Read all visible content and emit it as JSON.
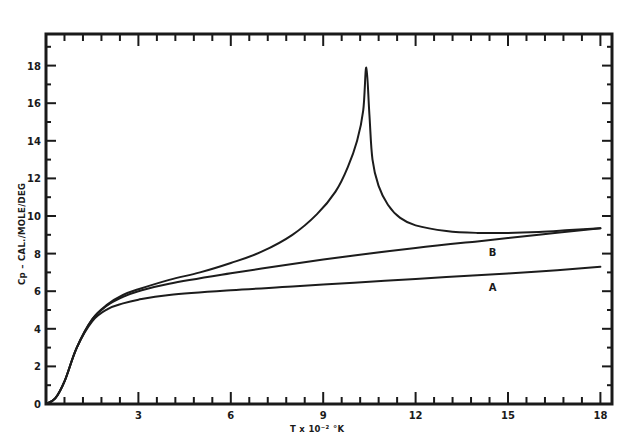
{
  "chart_data": {
    "type": "line",
    "title": "",
    "xlabel": "T x 10⁻² °K",
    "ylabel": "Cp – CAL./MOLE/DEG",
    "xlim": [
      0,
      18.5
    ],
    "ylim": [
      0,
      19.5
    ],
    "grid": false,
    "legend": "inline curve labels",
    "x_ticks": [
      0,
      3,
      6,
      9,
      12,
      15,
      18
    ],
    "x_tick_labels": [
      "",
      "3",
      "6",
      "9",
      "12",
      "15",
      "18"
    ],
    "x_minor_step": 0.6,
    "y_ticks": [
      0,
      2,
      4,
      6,
      8,
      10,
      12,
      14,
      16,
      18
    ],
    "y_tick_labels": [
      "0",
      "2",
      "4",
      "6",
      "8",
      "10",
      "12",
      "14",
      "16",
      "18"
    ],
    "y_minor_step": 1,
    "series": [
      {
        "name": "upper (lambda peak)",
        "label": "",
        "x": [
          0,
          0.3,
          0.6,
          1.0,
          1.5,
          2.0,
          2.5,
          3.0,
          4.0,
          5.0,
          6.0,
          7.0,
          8.0,
          8.8,
          9.4,
          9.8,
          10.1,
          10.3,
          10.4,
          10.5,
          10.6,
          10.8,
          11.1,
          11.5,
          12.0,
          13.0,
          14.0,
          15.0,
          16.0,
          17.0,
          18.0
        ],
        "y": [
          0,
          0.3,
          1.2,
          3.0,
          4.5,
          5.3,
          5.8,
          6.1,
          6.6,
          7.0,
          7.5,
          8.1,
          9.0,
          10.1,
          11.3,
          12.6,
          14.0,
          15.6,
          17.9,
          15.4,
          13.0,
          11.6,
          10.6,
          9.9,
          9.5,
          9.2,
          9.1,
          9.1,
          9.15,
          9.25,
          9.35
        ]
      },
      {
        "name": "B",
        "label": "B",
        "x": [
          0,
          0.3,
          0.6,
          1.0,
          1.5,
          2.0,
          2.5,
          3.0,
          4.0,
          6.0,
          8.0,
          10.0,
          12.0,
          14.0,
          16.0,
          18.0
        ],
        "y": [
          0,
          0.3,
          1.2,
          3.0,
          4.5,
          5.25,
          5.7,
          6.0,
          6.4,
          6.95,
          7.45,
          7.9,
          8.3,
          8.65,
          9.0,
          9.35
        ]
      },
      {
        "name": "A",
        "label": "A",
        "x": [
          0,
          0.3,
          0.6,
          1.0,
          1.5,
          2.0,
          2.5,
          3.0,
          4.0,
          6.0,
          8.0,
          10.0,
          12.0,
          14.0,
          16.0,
          18.0
        ],
        "y": [
          0,
          0.3,
          1.2,
          3.0,
          4.4,
          5.05,
          5.35,
          5.55,
          5.8,
          6.05,
          6.25,
          6.45,
          6.65,
          6.85,
          7.05,
          7.3
        ]
      }
    ],
    "annotations": [
      {
        "text": "B",
        "x": 14.5,
        "y": 8.1
      },
      {
        "text": "A",
        "x": 14.5,
        "y": 6.2
      }
    ]
  },
  "layout": {
    "plot_left": 46,
    "plot_right": 612,
    "plot_top": 34,
    "plot_bottom": 404,
    "x_px_per_unit": 30.8,
    "y_px_per_unit": 18.8,
    "ink_color": "#1a1a1a"
  }
}
